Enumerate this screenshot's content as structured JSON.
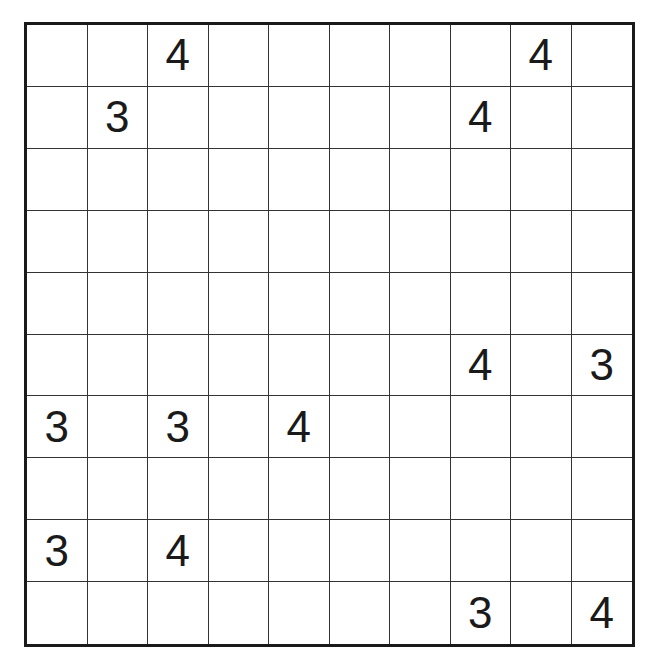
{
  "puzzle": {
    "rows": 10,
    "cols": 10,
    "grid": [
      [
        "",
        "",
        "4",
        "",
        "",
        "",
        "",
        "",
        "4",
        ""
      ],
      [
        "",
        "3",
        "",
        "",
        "",
        "",
        "",
        "4",
        "",
        ""
      ],
      [
        "",
        "",
        "",
        "",
        "",
        "",
        "",
        "",
        "",
        ""
      ],
      [
        "",
        "",
        "",
        "",
        "",
        "",
        "",
        "",
        "",
        ""
      ],
      [
        "",
        "",
        "",
        "",
        "",
        "",
        "",
        "",
        "",
        ""
      ],
      [
        "",
        "",
        "",
        "",
        "",
        "",
        "",
        "4",
        "",
        "3"
      ],
      [
        "3",
        "",
        "3",
        "",
        "4",
        "",
        "",
        "",
        "",
        ""
      ],
      [
        "",
        "",
        "",
        "",
        "",
        "",
        "",
        "",
        "",
        ""
      ],
      [
        "3",
        "",
        "4",
        "",
        "",
        "",
        "",
        "",
        "",
        ""
      ],
      [
        "",
        "",
        "",
        "",
        "",
        "",
        "",
        "3",
        "",
        "4"
      ]
    ]
  }
}
